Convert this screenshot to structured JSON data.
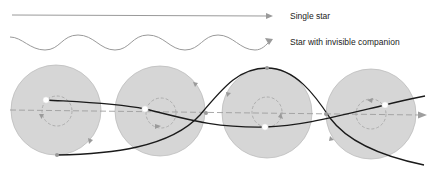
{
  "legend": {
    "single_star": "Single star",
    "star_with_companion": "Star with invisible companion"
  },
  "colors": {
    "background": "#ffffff",
    "disc_fill": "#d6d6d6",
    "disc_stroke": "#bdbdbd",
    "legend_line": "#9a9a9a",
    "path_line": "#1a1a1a",
    "axis_dash": "#9e9e9e",
    "inner_orbit": "#a8a8a8",
    "star_dot": "#ffffff",
    "marker": "#9a9a9a"
  },
  "diagram": {
    "discs": [
      {
        "cx": 56,
        "cy": 110,
        "r": 45,
        "inner_cx": 57,
        "inner_cy": 111,
        "inner_r": 15,
        "star": [
          46,
          100
        ]
      },
      {
        "cx": 160,
        "cy": 111,
        "r": 45,
        "inner_cx": 161,
        "inner_cy": 113,
        "inner_r": 15,
        "star": [
          145,
          109
        ]
      },
      {
        "cx": 267,
        "cy": 113,
        "r": 45,
        "inner_cx": 267,
        "inner_cy": 112,
        "inner_r": 15,
        "star": [
          265,
          127
        ]
      },
      {
        "cx": 371,
        "cy": 114,
        "r": 45,
        "inner_cx": 371,
        "inner_cy": 114,
        "inner_r": 15,
        "star": [
          385,
          105
        ]
      }
    ]
  }
}
